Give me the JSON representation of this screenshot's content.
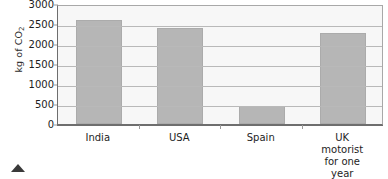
{
  "chart_data": {
    "type": "bar",
    "title": "",
    "xlabel": "",
    "ylabel": "kg of CO2",
    "ylabel_prefix": "kg of CO",
    "ylabel_subscript": "2",
    "categories": [
      "India",
      "USA",
      "Spain",
      "UK motorist for one year"
    ],
    "category_lines": [
      [
        "India"
      ],
      [
        "USA"
      ],
      [
        "Spain"
      ],
      [
        "UK motorist",
        "for one year"
      ]
    ],
    "values": [
      2600,
      2400,
      450,
      2280
    ],
    "ylim": [
      0,
      3000
    ],
    "yticks": [
      0,
      500,
      1000,
      1500,
      2000,
      2500,
      3000
    ],
    "ytick_labels": [
      "0",
      "500",
      "1000",
      "1500",
      "2000",
      "2500",
      "3000"
    ],
    "grid": true,
    "legend": "none",
    "bar_color": "#b6b6b6",
    "plot_background": "#f7f7f7",
    "gridline_color": "#b9b9b9",
    "axis_color": "#6e6e6e"
  },
  "marker": {
    "caret_name": "triangle-up-marker"
  }
}
